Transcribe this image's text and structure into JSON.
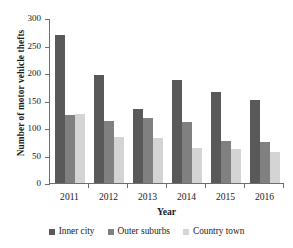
{
  "chart_data": {
    "type": "bar",
    "title": "",
    "subtitle": "",
    "xlabel": "Year",
    "ylabel": "Number of motor vehicle thefts",
    "categories": [
      "2011",
      "2012",
      "2013",
      "2014",
      "2015",
      "2016"
    ],
    "series": [
      {
        "name": "Inner city",
        "color": "#595959",
        "values": [
          270,
          196,
          135,
          188,
          165,
          151
        ]
      },
      {
        "name": "Outer suburbs",
        "color": "#808080",
        "values": [
          124,
          113,
          119,
          111,
          76,
          74
        ]
      },
      {
        "name": "Country town",
        "color": "#d4d4d4",
        "values": [
          126,
          84,
          81,
          63,
          61,
          57
        ]
      }
    ],
    "ylim": [
      0,
      300
    ],
    "ytick_labels": [
      "300",
      "250",
      "200",
      "150",
      "100",
      "50",
      "0"
    ],
    "ytick_values": [
      300,
      250,
      200,
      150,
      100,
      50,
      0
    ],
    "grid": false,
    "legend_position": "bottom"
  }
}
